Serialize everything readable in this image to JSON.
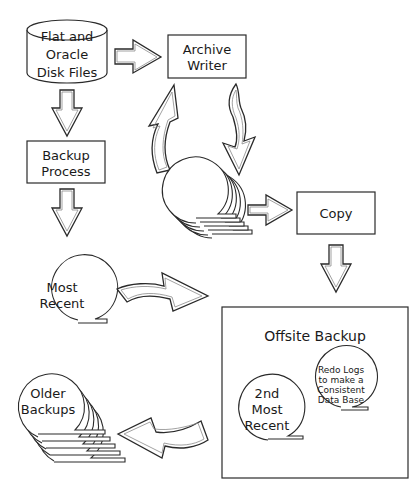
{
  "diagram": {
    "nodes": {
      "disk_files": {
        "lines": [
          "Flat and",
          "Oracle",
          "Disk Files"
        ],
        "shape": "cylinder"
      },
      "archive_writer": {
        "lines": [
          "Archive",
          "Writer"
        ],
        "shape": "box"
      },
      "backup_process": {
        "lines": [
          "Backup",
          "Process"
        ],
        "shape": "box"
      },
      "redo_tapes": {
        "lines": [],
        "shape": "tape-stack"
      },
      "copy": {
        "lines": [
          "Copy"
        ],
        "shape": "box"
      },
      "most_recent": {
        "lines": [
          "Most",
          "Recent"
        ],
        "shape": "tape-reel"
      },
      "offsite_backup": {
        "title": "Offsite Backup",
        "shape": "box"
      },
      "redo_logs": {
        "lines": [
          "Redo Logs",
          "to make a",
          "Consistent",
          "Data Base"
        ],
        "shape": "tape-reel"
      },
      "second_most_recent": {
        "lines": [
          "2nd",
          "Most",
          "Recent"
        ],
        "shape": "tape-reel"
      },
      "older_backups": {
        "lines": [
          "Older",
          "Backups"
        ],
        "shape": "tape-stack"
      }
    },
    "edges": [
      {
        "from": "disk_files",
        "to": "archive_writer",
        "style": "block-arrow"
      },
      {
        "from": "disk_files",
        "to": "backup_process",
        "style": "block-arrow"
      },
      {
        "from": "redo_tapes",
        "to": "archive_writer",
        "style": "curved-arrow"
      },
      {
        "from": "archive_writer",
        "to": "redo_tapes",
        "style": "curved-arrow"
      },
      {
        "from": "backup_process",
        "to": "most_recent",
        "style": "block-arrow"
      },
      {
        "from": "redo_tapes",
        "to": "copy",
        "style": "block-arrow"
      },
      {
        "from": "copy",
        "to": "offsite_backup",
        "style": "block-arrow"
      },
      {
        "from": "most_recent",
        "to": "offsite_backup",
        "style": "curved-arrow"
      },
      {
        "from": "offsite_backup",
        "to": "older_backups",
        "style": "curved-arrow"
      }
    ]
  }
}
